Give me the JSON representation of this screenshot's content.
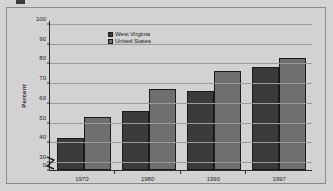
{
  "chart_data": {
    "type": "bar",
    "title": "",
    "xlabel": "",
    "ylabel": "Percent",
    "categories": [
      "1970",
      "1980",
      "1990",
      "1997"
    ],
    "series": [
      {
        "name": "West Virginia",
        "color": "#3b3b3b",
        "values": [
          42,
          56,
          66,
          78
        ]
      },
      {
        "name": "United States",
        "color": "#6f6f6f",
        "values": [
          53,
          67,
          76,
          83
        ]
      }
    ],
    "ylim": [
      0,
      100
    ],
    "yticks": [
      "0",
      "30",
      "40",
      "50",
      "60",
      "70",
      "80",
      "90",
      "100"
    ],
    "grid": true,
    "axis_break": "y-axis broken between 0 and 30",
    "legend_position": "top-left inside plot"
  },
  "legend": {
    "items": [
      {
        "label": "West Virginia"
      },
      {
        "label": "United States"
      }
    ]
  },
  "axis": {
    "y_title": "Percent",
    "y_ticks": [
      {
        "label": "100",
        "value": 100
      },
      {
        "label": "90",
        "value": 90
      },
      {
        "label": "80",
        "value": 80
      },
      {
        "label": "70",
        "value": 70
      },
      {
        "label": "60",
        "value": 60
      },
      {
        "label": "50",
        "value": 50
      },
      {
        "label": "40",
        "value": 40
      },
      {
        "label": "30",
        "value": 30
      },
      {
        "label": "0",
        "value": 0
      }
    ],
    "x_ticks": [
      {
        "label": "1970"
      },
      {
        "label": "1980"
      },
      {
        "label": "1990"
      },
      {
        "label": "1997"
      }
    ]
  },
  "colors": {
    "page_background": "#d4d4d4",
    "plot_background": "#d2d2d2",
    "frame_border": "#8a8a8a",
    "axis": "#2b2b2b",
    "gridline": "#9a9a9a",
    "series_west_virginia": "#3b3b3b",
    "series_united_states": "#6f6f6f"
  }
}
